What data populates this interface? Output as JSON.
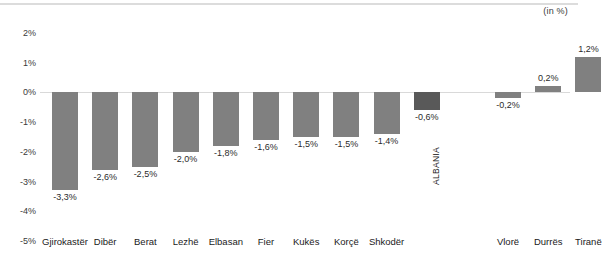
{
  "unit_note": "(in %)",
  "chart_data": {
    "type": "bar",
    "title": "",
    "subtitle": "",
    "xlabel": "",
    "ylabel": "",
    "unit_note": "(in %)",
    "ylim": [
      -5,
      2
    ],
    "ytick_labels": [
      "2%",
      "1%",
      "0%",
      "-1%",
      "-2%",
      "-3%",
      "-4%",
      "-5%"
    ],
    "ytick_values": [
      2,
      1,
      0,
      -1,
      -2,
      -3,
      -4,
      -5
    ],
    "grid": false,
    "zero_line": true,
    "legend": "none",
    "bar_color": "#808080",
    "highlight_color": "#595959",
    "highlight_category": "ALBANIA",
    "gap_after_index": 9,
    "categories": [
      "Gjirokastër",
      "Dibër",
      "Berat",
      "Lezhë",
      "Elbasan",
      "Fier",
      "Kukës",
      "Korçë",
      "Shkodër",
      "ALBANIA",
      "Vlorë",
      "Durrës",
      "Tiranë"
    ],
    "values": [
      -3.3,
      -2.6,
      -2.5,
      -2.0,
      -1.8,
      -1.6,
      -1.5,
      -1.5,
      -1.4,
      -0.6,
      -0.2,
      0.2,
      1.2
    ],
    "value_labels": [
      "-3,3%",
      "-2,6%",
      "-2,5%",
      "-2,0%",
      "-1,8%",
      "-1,6%",
      "-1,5%",
      "-1,5%",
      "-1,4%",
      "-0,6%",
      "-0,2%",
      "0,2%",
      "1,2%"
    ],
    "axis_category_labels": [
      "Gjirokastër",
      "Dibër",
      "Berat",
      "Lezhë",
      "Elbasan",
      "Fier",
      "Kukës",
      "Korçë",
      "Shkodër",
      "",
      "Vlorë",
      "Durrës",
      "Tiranë"
    ]
  }
}
